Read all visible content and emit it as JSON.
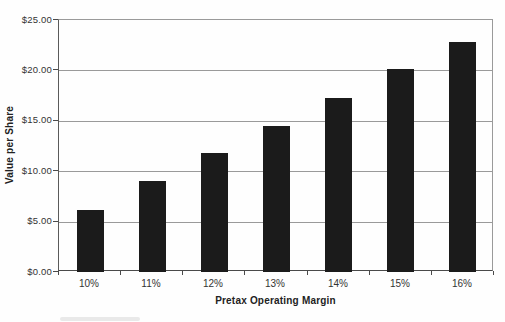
{
  "chart_data": {
    "type": "bar",
    "title": "",
    "categories": [
      "10%",
      "11%",
      "12%",
      "13%",
      "14%",
      "15%",
      "16%"
    ],
    "values": [
      6.2,
      9.0,
      11.8,
      14.5,
      17.3,
      20.1,
      22.8
    ],
    "xlabel": "Pretax Operating Margin",
    "ylabel": "Value per Share",
    "ylim": [
      0,
      25
    ],
    "ytick_step": 5,
    "ytick_labels": [
      "$0.00",
      "$5.00",
      "$10.00",
      "$15.00",
      "$20.00",
      "$25.00"
    ],
    "grid": true,
    "legend": "none",
    "colors": {
      "bar": "#1b1b1b",
      "gridline": "#9a9a9a",
      "axis": "#4a4a4a",
      "text": "#333333",
      "background": "#fefefe"
    }
  }
}
